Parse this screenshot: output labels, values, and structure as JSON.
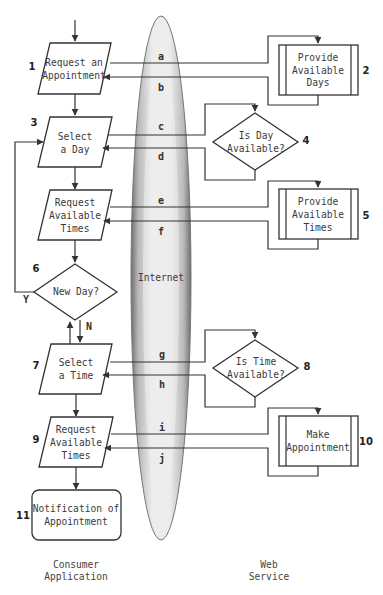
{
  "cloud": {
    "label": "Internet"
  },
  "consumer": {
    "caption_line1": "Consumer",
    "caption_line2": "Application",
    "steps": [
      {
        "num": "1",
        "shape": "parallelogram",
        "lines": [
          "Request an",
          "Appointment"
        ]
      },
      {
        "num": "3",
        "shape": "parallelogram",
        "lines": [
          "Select",
          "a Day"
        ]
      },
      {
        "num": "",
        "shape": "parallelogram",
        "lines": [
          "Request",
          "Available",
          "Times"
        ]
      },
      {
        "num": "6",
        "shape": "diamond",
        "lines": [
          "New Day?"
        ]
      },
      {
        "num": "7",
        "shape": "parallelogram",
        "lines": [
          "Select",
          "a Time"
        ]
      },
      {
        "num": "9",
        "shape": "parallelogram",
        "lines": [
          "Request",
          "Available",
          "Times"
        ]
      },
      {
        "num": "11",
        "shape": "rounded-rect",
        "lines": [
          "Notification of",
          "Appointment"
        ]
      }
    ],
    "branch_yes": "Y",
    "branch_no": "N"
  },
  "service": {
    "caption_line1": "Web",
    "caption_line2": "Service",
    "steps": [
      {
        "num": "2",
        "shape": "process",
        "lines": [
          "Provide",
          "Available",
          "Days"
        ]
      },
      {
        "num": "4",
        "shape": "diamond",
        "lines": [
          "Is Day",
          "Available?"
        ]
      },
      {
        "num": "5",
        "shape": "process",
        "lines": [
          "Provide",
          "Available",
          "Times"
        ]
      },
      {
        "num": "8",
        "shape": "diamond",
        "lines": [
          "Is Time",
          "Available?"
        ]
      },
      {
        "num": "10",
        "shape": "process",
        "lines": [
          "Make",
          "Appointment"
        ]
      }
    ]
  },
  "messages": [
    "a",
    "b",
    "c",
    "d",
    "e",
    "f",
    "g",
    "h",
    "i",
    "j"
  ]
}
